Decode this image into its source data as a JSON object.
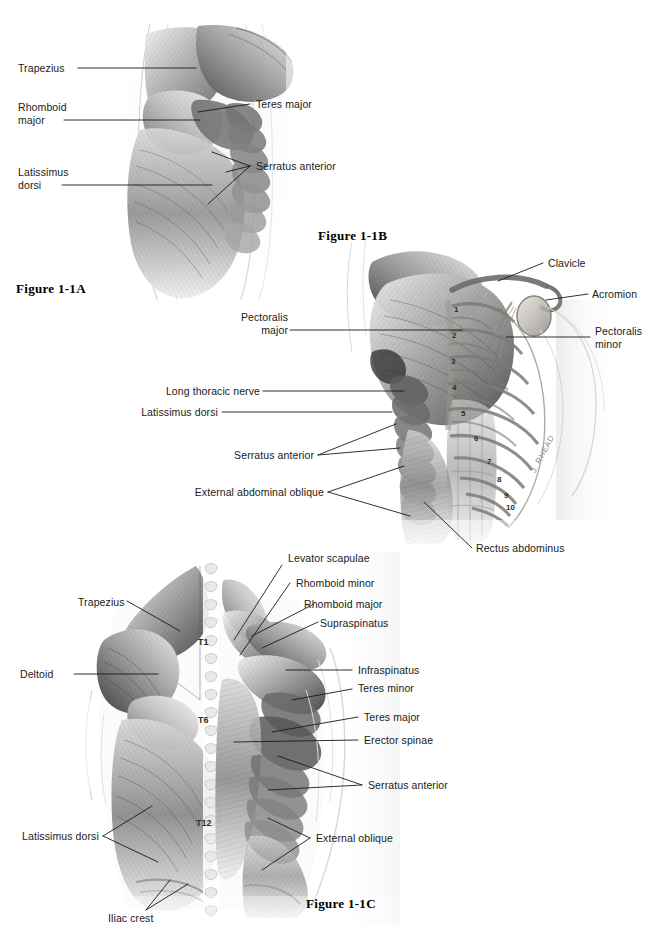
{
  "page": {
    "background": "#ffffff",
    "width": 657,
    "height": 930,
    "artist_signature": "J. RHEAD"
  },
  "figures": [
    {
      "id": "figure-1-1a",
      "title": "Figure 1-1A",
      "view": "posterior shoulder, superficial back muscles",
      "labels": [
        {
          "name": "trapezius",
          "text": "Trapezius",
          "side": "left"
        },
        {
          "name": "rhomboid-major",
          "text": "Rhomboid\nmajor",
          "side": "left"
        },
        {
          "name": "latissimus-dorsi",
          "text": "Latissimus\ndorsi",
          "side": "left"
        },
        {
          "name": "teres-major",
          "text": "Teres major",
          "side": "right"
        },
        {
          "name": "serratus-anterior",
          "text": "Serratus anterior",
          "side": "right"
        }
      ]
    },
    {
      "id": "figure-1-1b",
      "title": "Figure 1-1B",
      "view": "anterior chest, pectoral region with rib cage",
      "labels": [
        {
          "name": "pectoralis-major",
          "text": "Pectoralis\nmajor",
          "side": "left"
        },
        {
          "name": "long-thoracic-nerve",
          "text": "Long thoracic nerve",
          "side": "left"
        },
        {
          "name": "latissimus-dorsi",
          "text": "Latissimus dorsi",
          "side": "left"
        },
        {
          "name": "serratus-anterior",
          "text": "Serratus anterior",
          "side": "left"
        },
        {
          "name": "external-abdominal-oblique",
          "text": "External abdominal oblique",
          "side": "left"
        },
        {
          "name": "clavicle",
          "text": "Clavicle",
          "side": "right"
        },
        {
          "name": "acromion",
          "text": "Acromion",
          "side": "right"
        },
        {
          "name": "pectoralis-minor",
          "text": "Pectoralis\nminor",
          "side": "right"
        },
        {
          "name": "rectus-abdominus",
          "text": "Rectus abdominus",
          "side": "bottom"
        }
      ],
      "rib_numbers": [
        "1",
        "2",
        "3",
        "4",
        "5",
        "6",
        "7",
        "8",
        "9",
        "10"
      ]
    },
    {
      "id": "figure-1-1c",
      "title": "Figure 1-1C",
      "view": "posterior back, superficial and deep layers",
      "labels": [
        {
          "name": "trapezius",
          "text": "Trapezius",
          "side": "left"
        },
        {
          "name": "deltoid",
          "text": "Deltoid",
          "side": "left"
        },
        {
          "name": "latissimus-dorsi",
          "text": "Latissimus dorsi",
          "side": "left"
        },
        {
          "name": "iliac-crest",
          "text": "Iliac crest",
          "side": "bottom"
        },
        {
          "name": "levator-scapulae",
          "text": "Levator scapulae",
          "side": "right"
        },
        {
          "name": "rhomboid-minor",
          "text": "Rhomboid minor",
          "side": "right"
        },
        {
          "name": "rhomboid-major",
          "text": "Rhomboid major",
          "side": "right"
        },
        {
          "name": "supraspinatus",
          "text": "Supraspinatus",
          "side": "right"
        },
        {
          "name": "infraspinatus",
          "text": "Infraspinatus",
          "side": "right"
        },
        {
          "name": "teres-minor",
          "text": "Teres minor",
          "side": "right"
        },
        {
          "name": "teres-major",
          "text": "Teres major",
          "side": "right"
        },
        {
          "name": "erector-spinae",
          "text": "Erector spinae",
          "side": "right"
        },
        {
          "name": "serratus-anterior",
          "text": "Serratus anterior",
          "side": "right"
        },
        {
          "name": "external-oblique",
          "text": "External oblique",
          "side": "right"
        }
      ],
      "vertebrae": [
        "T1",
        "T6",
        "T12"
      ]
    }
  ]
}
